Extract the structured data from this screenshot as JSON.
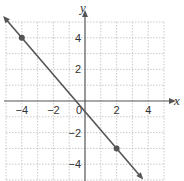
{
  "chart_data": {
    "type": "line",
    "title": "",
    "xlabel": "x",
    "ylabel": "y",
    "xlim": [
      -5,
      5
    ],
    "ylim": [
      -5,
      5
    ],
    "grid": true,
    "x_ticks": [
      -4,
      -2,
      2,
      4
    ],
    "y_ticks": [
      4,
      2,
      -2,
      -4
    ],
    "x_tick_labels": [
      "−4",
      "−2",
      "2",
      "4"
    ],
    "y_tick_labels": [
      "4",
      "2",
      "−2",
      "−4"
    ],
    "origin_label": "0",
    "series": [
      {
        "name": "line",
        "equation": "y = -7/6 x - 2/3",
        "slope": -1.1667,
        "intercept": -0.6667,
        "arrows": "both",
        "marked_points": [
          {
            "x": -4,
            "y": 4
          },
          {
            "x": 2,
            "y": -3
          }
        ]
      }
    ],
    "colors": {
      "line": "#555555",
      "points": "#555555",
      "axes": "#555555",
      "grid": "#bbbbbb"
    }
  }
}
